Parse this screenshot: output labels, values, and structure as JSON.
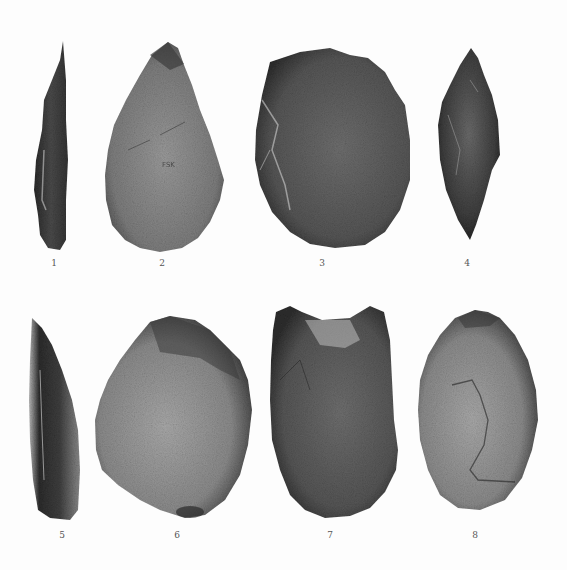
{
  "plate": {
    "background": "#fdfdfd",
    "artifacts": [
      {
        "number": "1",
        "shape": "narrow-blade-side-view",
        "tone": "dark"
      },
      {
        "number": "2",
        "shape": "pointed-handaxe",
        "tone": "medium-gray",
        "mark": "FSK"
      },
      {
        "number": "3",
        "shape": "ovate-disc",
        "tone": "dark-gray"
      },
      {
        "number": "4",
        "shape": "bifacial-point-side-view",
        "tone": "dark"
      },
      {
        "number": "5",
        "shape": "blade-side-view",
        "tone": "dark"
      },
      {
        "number": "6",
        "shape": "rounded-cleaver",
        "tone": "light-gray-with-dark-rim"
      },
      {
        "number": "7",
        "shape": "squared-top-cleaver",
        "tone": "dark-gray"
      },
      {
        "number": "8",
        "shape": "oval-handaxe",
        "tone": "light-gray"
      }
    ]
  }
}
